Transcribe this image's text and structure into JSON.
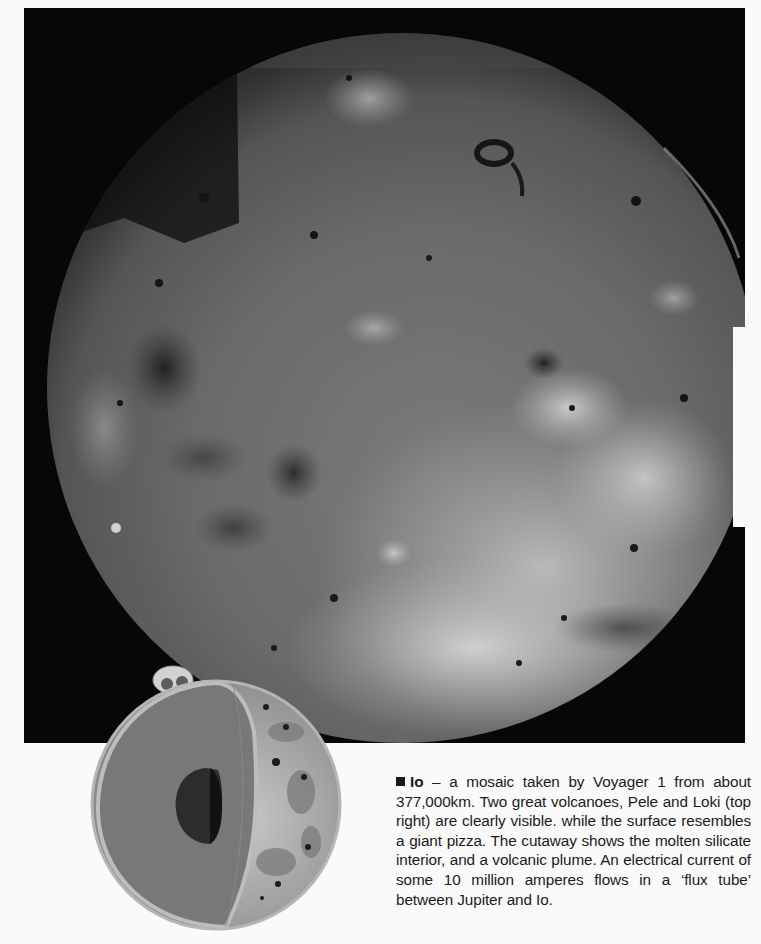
{
  "page": {
    "photo": {
      "subject": "Io",
      "description": "Voyager 1 mosaic photograph of Jupiter's moon Io",
      "colors": {
        "space": "#070707",
        "surface_base": "#6b6b6b",
        "surface_light": "#d8d8d8",
        "surface_dark": "#262626"
      }
    },
    "cutaway": {
      "description": "Cutaway illustration of Io showing molten silicate interior, core and volcanic plume",
      "colors": {
        "mantle": "#787878",
        "crust": "#bdbdbd",
        "core": "#2c2c2c"
      }
    },
    "caption": {
      "bullet_icon": "square-bullet-icon",
      "subject": "Io",
      "text": " – a mosaic taken by Voyager 1 from about 377,000km. Two great volcanoes, Pele and Loki (top right) are clearly visible. while the surface resembles a giant pizza. The cutaway shows the molten silicate interior, and a volcanic plume. An electrical current of some 10 million amperes flows in a ‘flux tube’ between Jupiter and Io."
    }
  }
}
